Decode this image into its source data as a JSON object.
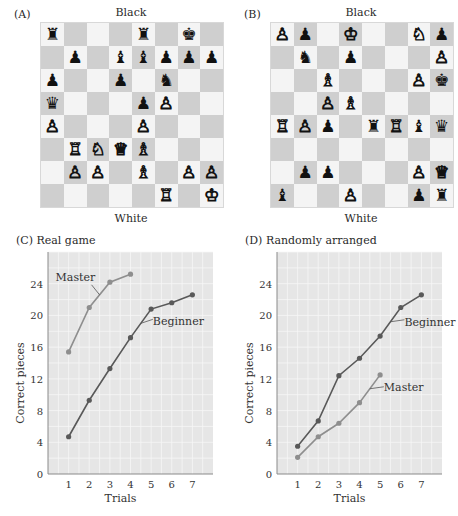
{
  "panels": {
    "A": {
      "label": "(A)",
      "top_label": "Black",
      "bottom_label": "White",
      "board": [
        [
          "bR",
          "",
          "",
          "",
          "bR",
          "",
          "bK",
          ""
        ],
        [
          "",
          "bP",
          "",
          "bB",
          "bB",
          "bP",
          "bP",
          "bP"
        ],
        [
          "bP",
          "",
          "",
          "bP",
          "",
          "bN",
          "",
          ""
        ],
        [
          "bQ",
          "",
          "",
          "",
          "bP",
          "wP",
          "",
          ""
        ],
        [
          "wP",
          "",
          "",
          "",
          "wP",
          "",
          "",
          ""
        ],
        [
          "",
          "wR",
          "wN",
          "wQ",
          "wB",
          "",
          "",
          ""
        ],
        [
          "",
          "wP",
          "wP",
          "",
          "wB",
          "",
          "wP",
          "wP"
        ],
        [
          "",
          "",
          "",
          "",
          "",
          "wR",
          "",
          "wK"
        ]
      ]
    },
    "B": {
      "label": "(B)",
      "top_label": "Black",
      "bottom_label": "White",
      "board": [
        [
          "wP",
          "bP",
          "",
          "wK",
          "",
          "",
          "wN",
          "bP"
        ],
        [
          "",
          "bN",
          "",
          "bP",
          "",
          "",
          "",
          "wP"
        ],
        [
          "",
          "",
          "wB",
          "",
          "",
          "",
          "wP",
          "bK"
        ],
        [
          "",
          "",
          "wP",
          "wB",
          "",
          "",
          "",
          ""
        ],
        [
          "wR",
          "wP",
          "bP",
          "",
          "bR",
          "wR",
          "bB",
          "bQ"
        ],
        [
          "",
          "",
          "",
          "",
          "",
          "",
          "",
          ""
        ],
        [
          "",
          "bP",
          "bP",
          "",
          "",
          "",
          "wP",
          "wQ"
        ],
        [
          "bB",
          "",
          "",
          "wP",
          "",
          "",
          "bP",
          "bR"
        ]
      ]
    }
  },
  "pieces": {
    "wK": "♔",
    "wQ": "♕",
    "wR": "♖",
    "wB": "♗",
    "wN": "♘",
    "wP": "♙",
    "bK": "♚",
    "bQ": "♛",
    "bR": "♜",
    "bB": "♝",
    "bN": "♞",
    "bP": "♟"
  },
  "chart_data": [
    {
      "type": "line",
      "panel_label": "(C)",
      "title": "Real game",
      "xlabel": "Trials",
      "ylabel": "Correct pieces",
      "x_ticks": [
        1,
        2,
        3,
        4,
        5,
        6,
        7
      ],
      "y_ticks": [
        0,
        4,
        8,
        12,
        16,
        20,
        24
      ],
      "xlim": [
        0,
        8
      ],
      "ylim": [
        0,
        28
      ],
      "grid": true,
      "series": [
        {
          "name": "Master",
          "color": "#8e8e8e",
          "x": [
            1,
            2,
            3,
            4
          ],
          "values": [
            15.4,
            21.0,
            24.2,
            25.2
          ]
        },
        {
          "name": "Beginner",
          "color": "#595959",
          "x": [
            1,
            2,
            3,
            4,
            5,
            6,
            7
          ],
          "values": [
            4.7,
            9.3,
            13.3,
            17.2,
            20.8,
            21.6,
            22.6
          ]
        }
      ]
    },
    {
      "type": "line",
      "panel_label": "(D)",
      "title": "Randomly arranged",
      "xlabel": "Trials",
      "ylabel": "Correct pieces",
      "x_ticks": [
        1,
        2,
        3,
        4,
        5,
        6,
        7
      ],
      "y_ticks": [
        0,
        4,
        8,
        12,
        16,
        20,
        24
      ],
      "xlim": [
        0,
        8
      ],
      "ylim": [
        0,
        28
      ],
      "grid": true,
      "series": [
        {
          "name": "Beginner",
          "color": "#595959",
          "x": [
            1,
            2,
            3,
            4,
            5,
            6,
            7
          ],
          "values": [
            3.5,
            6.7,
            12.4,
            14.6,
            17.4,
            21.0,
            22.6
          ]
        },
        {
          "name": "Master",
          "color": "#8e8e8e",
          "x": [
            1,
            2,
            3,
            4,
            5
          ],
          "values": [
            2.1,
            4.7,
            6.4,
            9.0,
            12.5
          ]
        }
      ]
    }
  ]
}
